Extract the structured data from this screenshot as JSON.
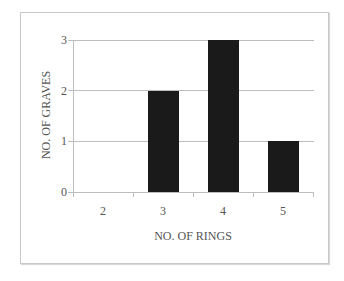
{
  "chart_data": {
    "type": "bar",
    "title": "",
    "xlabel": "NO. OF RINGS",
    "ylabel": "NO. OF GRAVES",
    "categories": [
      "2",
      "3",
      "4",
      "5"
    ],
    "values": [
      0,
      2,
      3,
      1
    ],
    "ylim": [
      0,
      3
    ],
    "yticks": [
      "0",
      "1",
      "2",
      "3"
    ],
    "grid": true,
    "legend": null,
    "bar_color": "#1a1a1a"
  }
}
